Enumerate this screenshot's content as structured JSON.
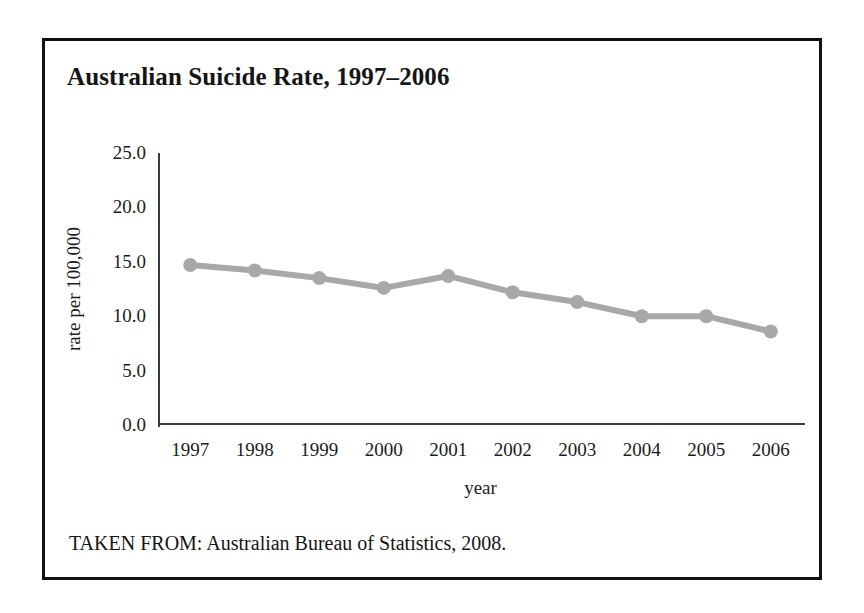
{
  "figure": {
    "title": "Australian Suicide Rate, 1997–2006",
    "source_note": "TAKEN FROM: Australian Bureau of Statistics, 2008.",
    "border_color": "#101010",
    "background_color": "#ffffff"
  },
  "chart_data": {
    "type": "line",
    "title": "Australian Suicide Rate, 1997–2006",
    "xlabel": "year",
    "ylabel": "rate per 100,000",
    "categories": [
      "1997",
      "1998",
      "1999",
      "2000",
      "2001",
      "2002",
      "2003",
      "2004",
      "2005",
      "2006"
    ],
    "values": [
      14.7,
      14.2,
      13.5,
      12.6,
      13.7,
      12.2,
      11.3,
      10.0,
      10.0,
      8.6
    ],
    "x_tick_labels": [
      "1997",
      "1998",
      "1999",
      "2000",
      "2001",
      "2002",
      "2003",
      "2004",
      "2005",
      "2006"
    ],
    "y_tick_labels": [
      "0.0",
      "5.0",
      "10.0",
      "15.0",
      "20.0",
      "25.0"
    ],
    "y_tick_values": [
      0,
      5,
      10,
      15,
      20,
      25
    ],
    "ylim": [
      0,
      25
    ],
    "grid": false,
    "legend": false,
    "series_color": "#a8a8a8",
    "marker": "circle",
    "axis_color": "#3a3a3a"
  }
}
